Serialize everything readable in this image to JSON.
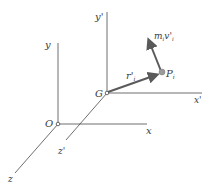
{
  "diagram": {
    "title": "",
    "frames": {
      "fixed": {
        "origin_label": "O",
        "x_label": "x",
        "y_label": "y",
        "z_label": "z"
      },
      "centroidal": {
        "origin_label": "G",
        "x_label": "x'",
        "y_label": "y'",
        "z_label": "z'"
      }
    },
    "vectors": {
      "position": {
        "label": "r'",
        "subscript": "i"
      },
      "momentum": {
        "label": "m",
        "subscript": "i",
        "label2": "v'",
        "subscript2": "i"
      }
    },
    "point": {
      "label": "P",
      "subscript": "i"
    },
    "colors": {
      "axis": "#4a4a4a",
      "vector": "#5a5a5a",
      "point_fill": "#9a9a9a",
      "text": "#3a3a3a"
    }
  }
}
